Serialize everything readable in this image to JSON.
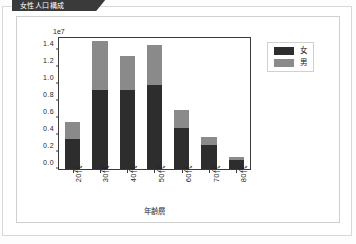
{
  "header": {
    "tab_label": "女性人口構成"
  },
  "chart_data": {
    "type": "bar",
    "subtype": "stacked-bar",
    "title": "",
    "exponent_label": "1e7",
    "xlabel": "年齢層",
    "ylabel": "",
    "categories": [
      "20代",
      "30代",
      "40代",
      "50代",
      "60代",
      "70代",
      "80代"
    ],
    "series": [
      {
        "name": "女",
        "color": "#2d2d2d",
        "values": [
          3500000,
          9300000,
          9300000,
          9800000,
          4850000,
          2850000,
          1050000
        ]
      },
      {
        "name": "男",
        "color": "#8a8a8a",
        "values": [
          2050000,
          5700000,
          4000000,
          4800000,
          2050000,
          950000,
          350000
        ]
      }
    ],
    "totals": [
      5550000,
      15000000,
      13300000,
      14600000,
      6900000,
      3800000,
      1400000
    ],
    "ylim": [
      0,
      15600000
    ],
    "ytick_values": [
      0,
      2000000,
      4000000,
      6000000,
      8000000,
      10000000,
      12000000,
      14000000
    ],
    "ytick_labels": [
      "0.0",
      "0.2",
      "0.4",
      "0.6",
      "0.8",
      "1.0",
      "1.2",
      "1.4"
    ],
    "grid": false,
    "legend_position": "upper right",
    "legend_entries": [
      "女",
      "男"
    ]
  }
}
